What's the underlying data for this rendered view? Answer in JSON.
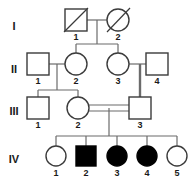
{
  "diagram": {
    "type": "pedigree-chart",
    "width": 194,
    "height": 183,
    "colors": {
      "background": "#ffffff",
      "stroke": "#3b3b3b",
      "line": "#6b6b6b",
      "affected_fill": "#000000",
      "unaffected_fill": "#ffffff",
      "text": "#1a1a1a"
    }
  },
  "generations": [
    {
      "label": "I",
      "label_x": 14,
      "label_y": 27
    },
    {
      "label": "II",
      "label_x": 14,
      "label_y": 70
    },
    {
      "label": "III",
      "label_x": 14,
      "label_y": 112
    },
    {
      "label": "IV",
      "label_x": 14,
      "label_y": 160
    }
  ],
  "individuals": [
    {
      "id": "I-1",
      "number": "1",
      "sex": "male",
      "affected": false,
      "deceased": true,
      "cx": 76,
      "cy": 20,
      "num_x": 76,
      "num_y": 36
    },
    {
      "id": "I-2",
      "number": "2",
      "sex": "female",
      "affected": false,
      "deceased": true,
      "cx": 118,
      "cy": 20,
      "num_x": 118,
      "num_y": 36
    },
    {
      "id": "II-1",
      "number": "1",
      "sex": "male",
      "affected": false,
      "deceased": false,
      "cx": 38,
      "cy": 64,
      "num_x": 38,
      "num_y": 80
    },
    {
      "id": "II-2",
      "number": "2",
      "sex": "female",
      "affected": false,
      "deceased": false,
      "cx": 76,
      "cy": 64,
      "num_x": 76,
      "num_y": 80
    },
    {
      "id": "II-3",
      "number": "3",
      "sex": "female",
      "affected": false,
      "deceased": false,
      "cx": 118,
      "cy": 64,
      "num_x": 118,
      "num_y": 80
    },
    {
      "id": "II-4",
      "number": "4",
      "sex": "male",
      "affected": false,
      "deceased": false,
      "cx": 157,
      "cy": 64,
      "num_x": 157,
      "num_y": 80
    },
    {
      "id": "III-1",
      "number": "1",
      "sex": "male",
      "affected": false,
      "deceased": false,
      "cx": 38,
      "cy": 108,
      "num_x": 38,
      "num_y": 124
    },
    {
      "id": "III-2",
      "number": "2",
      "sex": "female",
      "affected": false,
      "deceased": false,
      "cx": 78,
      "cy": 108,
      "num_x": 78,
      "num_y": 124
    },
    {
      "id": "III-3",
      "number": "3",
      "sex": "male",
      "affected": false,
      "deceased": false,
      "cx": 140,
      "cy": 108,
      "num_x": 140,
      "num_y": 124
    },
    {
      "id": "IV-1",
      "number": "1",
      "sex": "female",
      "affected": false,
      "deceased": false,
      "cx": 56,
      "cy": 156,
      "num_x": 56,
      "num_y": 172
    },
    {
      "id": "IV-2",
      "number": "2",
      "sex": "male",
      "affected": true,
      "deceased": false,
      "cx": 86,
      "cy": 156,
      "num_x": 86,
      "num_y": 172
    },
    {
      "id": "IV-3",
      "number": "3",
      "sex": "female",
      "affected": true,
      "deceased": false,
      "cx": 117,
      "cy": 156,
      "num_x": 117,
      "num_y": 172
    },
    {
      "id": "IV-4",
      "number": "4",
      "sex": "female",
      "affected": true,
      "deceased": false,
      "cx": 147,
      "cy": 156,
      "num_x": 147,
      "num_y": 172
    },
    {
      "id": "IV-5",
      "number": "5",
      "sex": "female",
      "affected": false,
      "deceased": false,
      "cx": 177,
      "cy": 156,
      "num_x": 177,
      "num_y": 172
    }
  ],
  "matings": [
    {
      "id": "I-1xI-2",
      "partners": [
        "I-1",
        "I-2"
      ],
      "consanguineous": false
    },
    {
      "id": "II-1xII-2",
      "partners": [
        "II-1",
        "II-2"
      ],
      "consanguineous": false
    },
    {
      "id": "II-3xII-4",
      "partners": [
        "II-3",
        "II-4"
      ],
      "consanguineous": false
    },
    {
      "id": "III-2xIII-3",
      "partners": [
        "III-2",
        "III-3"
      ],
      "consanguineous": true
    }
  ],
  "sibships": [
    {
      "id": "sibship-II",
      "parents": "I-1xI-2",
      "children": [
        "II-2",
        "II-3"
      ]
    },
    {
      "id": "sibship-III",
      "parents": "II-1xII-2",
      "children": [
        "III-1",
        "III-2"
      ]
    },
    {
      "id": "sibship-III-3",
      "parents": "II-3xII-4",
      "children": [
        "III-3"
      ]
    },
    {
      "id": "sibship-IV",
      "parents": "III-2xIII-3",
      "children": [
        "IV-1",
        "IV-2",
        "IV-3",
        "IV-4",
        "IV-5"
      ]
    }
  ]
}
